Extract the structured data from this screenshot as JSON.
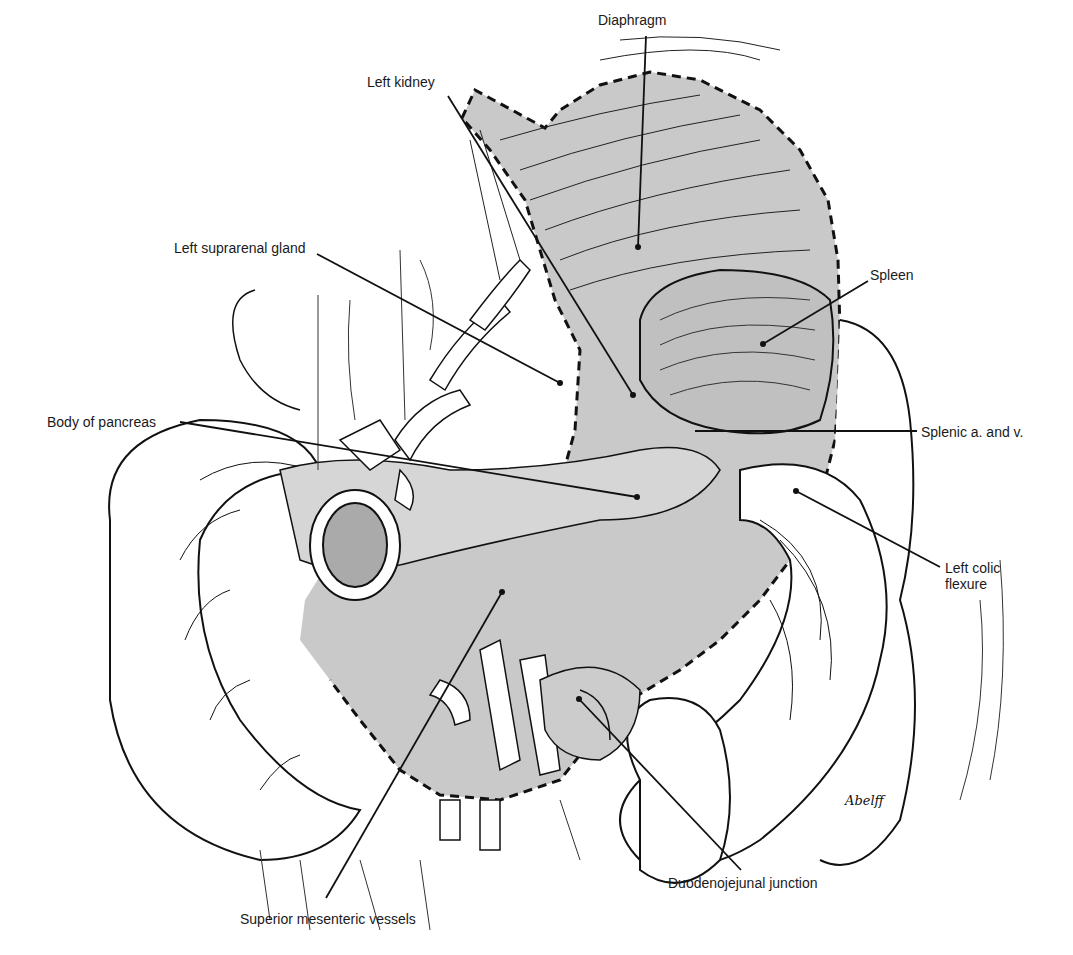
{
  "figure": {
    "shade_color": "#c8c8c8",
    "line_color": "#111111",
    "artist_signature": "Abelff"
  },
  "labels": [
    {
      "id": "diaphragm",
      "text": "Diaphragm"
    },
    {
      "id": "left-kidney",
      "text": "Left kidney"
    },
    {
      "id": "left-suprarenal-gland",
      "text": "Left suprarenal gland"
    },
    {
      "id": "spleen",
      "text": "Spleen"
    },
    {
      "id": "body-of-pancreas",
      "text": "Body of pancreas"
    },
    {
      "id": "splenic-a-and-v",
      "text": "Splenic a. and v."
    },
    {
      "id": "left-colic-flexure",
      "text": "Left colic\nflexure"
    },
    {
      "id": "superior-mesenteric-vessels",
      "text": "Superior mesenteric vessels"
    },
    {
      "id": "duodenojejunal-junction",
      "text": "Duodenojejunal junction"
    }
  ]
}
